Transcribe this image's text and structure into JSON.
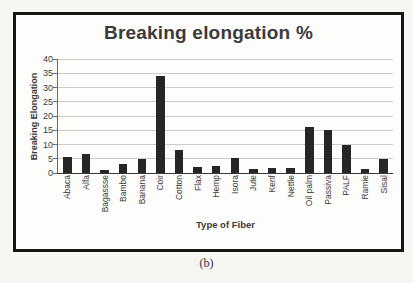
{
  "figure": {
    "caption": "(b)"
  },
  "chart_data": {
    "type": "bar",
    "title": "Breaking elongation %",
    "xlabel": "Type of Fiber",
    "ylabel": "Breaking Elongation",
    "ylim": [
      0,
      40
    ],
    "ytick_step": 5,
    "grid": true,
    "legend": "none",
    "bar_color": "#262626",
    "categories": [
      "Abaca",
      "Alfa",
      "Bagassse",
      "Bambo",
      "Banana",
      "Coir",
      "Cotton",
      "Flax",
      "Hemp",
      "Isora",
      "Jute",
      "Kenf",
      "Nettle",
      "Oil palm",
      "Passiva",
      "PALF",
      "Ramie",
      "Sisal"
    ],
    "values": [
      5.5,
      6.5,
      1.2,
      3,
      5,
      34,
      8,
      2.2,
      2.3,
      5.2,
      1.4,
      1.9,
      1.8,
      16,
      15,
      9.8,
      1.5,
      4.8
    ]
  }
}
